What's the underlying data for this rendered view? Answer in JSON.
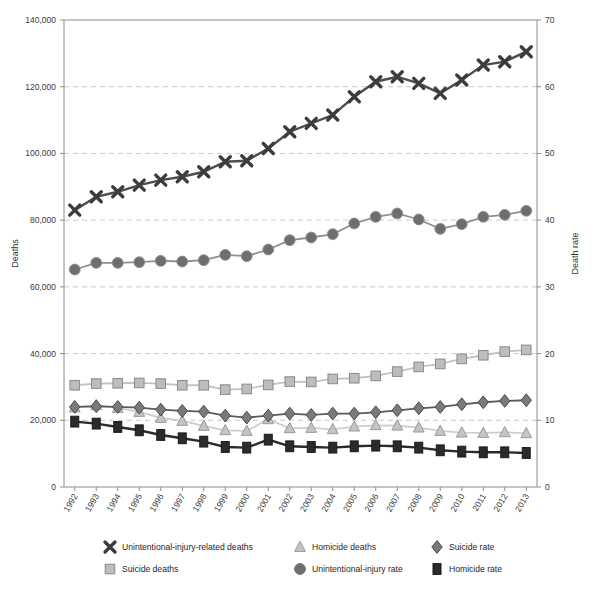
{
  "chart_data": {
    "type": "line",
    "title": "",
    "subtitle": "",
    "xlabel": "",
    "ylabel": "Deaths",
    "y2label": "Death rate",
    "grid": true,
    "legend_position": "bottom",
    "x": [
      "1992",
      "1993",
      "1994",
      "1995",
      "1996",
      "1997",
      "1998",
      "1999",
      "2000",
      "2001",
      "2002",
      "2003",
      "2004",
      "2005",
      "2006",
      "2007",
      "2008",
      "2009",
      "2010",
      "2011",
      "2012",
      "2013"
    ],
    "xtick_labels": [
      "1992",
      "1993",
      "1994",
      "1995",
      "1996",
      "1997",
      "1998",
      "1999",
      "2000",
      "2001",
      "2002",
      "2003",
      "2004",
      "2005",
      "2006",
      "2007",
      "2008",
      "2009",
      "2010",
      "2011",
      "2012",
      "2013"
    ],
    "ylim": [
      0,
      140000
    ],
    "ytick_labels": [
      "0",
      "20,000",
      "40,000",
      "60,000",
      "80,000",
      "100,000",
      "120,000",
      "140,000"
    ],
    "ytick_values": [
      0,
      20000,
      40000,
      60000,
      80000,
      100000,
      120000,
      140000
    ],
    "y2lim": [
      0,
      70
    ],
    "y2tick_labels": [
      "0",
      "10",
      "20",
      "30",
      "40",
      "50",
      "60",
      "70"
    ],
    "y2tick_values": [
      0,
      10,
      20,
      30,
      40,
      50,
      60,
      70
    ],
    "series": [
      {
        "name": "Unintentional-injury-related deaths",
        "marker": "x-cross",
        "axis": "left",
        "color": "#4d4d4d",
        "marker_fill": "#3c3c3c",
        "values": [
          83000,
          87000,
          88500,
          90500,
          92000,
          93000,
          94500,
          97500,
          97800,
          101500,
          106500,
          109000,
          111500,
          117000,
          121500,
          123000,
          121000,
          118000,
          122000,
          126500,
          127500,
          130500
        ]
      },
      {
        "name": "Suicide deaths",
        "marker": "square",
        "axis": "left",
        "color": "#c3c3c3",
        "marker_fill": "#bdbdbd",
        "values": [
          30500,
          31000,
          31100,
          31200,
          31000,
          30500,
          30500,
          29200,
          29400,
          30600,
          31600,
          31500,
          32400,
          32600,
          33300,
          34600,
          36000,
          36900,
          38400,
          39500,
          40600,
          41100
        ]
      },
      {
        "name": "Homicide deaths",
        "marker": "triangle",
        "axis": "left",
        "color": "#cdcdcd",
        "marker_fill": "#c4c4c4",
        "values": [
          23800,
          24500,
          23700,
          22500,
          20700,
          19800,
          18300,
          17000,
          16800,
          20300,
          17600,
          17700,
          17300,
          18100,
          18500,
          18400,
          17800,
          16800,
          16300,
          16200,
          16400,
          16100
        ]
      },
      {
        "name": "Unintentional-injury rate",
        "marker": "circle",
        "axis": "right",
        "color": "#8f8f8f",
        "marker_fill": "#6e6e6e",
        "values": [
          32.6,
          33.6,
          33.6,
          33.7,
          33.9,
          33.8,
          34.0,
          34.8,
          34.6,
          35.6,
          37.0,
          37.4,
          37.9,
          39.5,
          40.5,
          41.0,
          40.1,
          38.7,
          39.4,
          40.5,
          40.8,
          41.4
        ]
      },
      {
        "name": "Suicide rate",
        "marker": "diamond",
        "axis": "right",
        "color": "#5a5a5a",
        "marker_fill": "#7a7a7a",
        "values": [
          12.0,
          12.1,
          12.0,
          11.9,
          11.6,
          11.4,
          11.3,
          10.7,
          10.4,
          10.7,
          11.0,
          10.8,
          11.0,
          11.0,
          11.2,
          11.5,
          11.8,
          12.0,
          12.4,
          12.7,
          12.9,
          13.0
        ]
      },
      {
        "name": "Homicide rate",
        "marker": "rect-bar",
        "axis": "right",
        "color": "#2b2b2b",
        "marker_fill": "#2b2b2b",
        "values": [
          9.8,
          9.5,
          9.0,
          8.5,
          7.8,
          7.3,
          6.8,
          6.0,
          5.9,
          7.1,
          6.1,
          6.0,
          5.9,
          6.1,
          6.2,
          6.1,
          5.9,
          5.5,
          5.3,
          5.2,
          5.2,
          5.1
        ]
      }
    ],
    "legend": [
      {
        "label": "Unintentional-injury-related deaths",
        "marker": "x-cross",
        "color": "#3c3c3c"
      },
      {
        "label": "Homicide deaths",
        "marker": "triangle",
        "color": "#c4c4c4"
      },
      {
        "label": "Suicide rate",
        "marker": "diamond",
        "color": "#7a7a7a"
      },
      {
        "label": "Suicide deaths",
        "marker": "square",
        "color": "#bdbdbd"
      },
      {
        "label": "Unintentional-injury rate",
        "marker": "circle",
        "color": "#6e6e6e"
      },
      {
        "label": "Homicide rate",
        "marker": "rect-bar",
        "color": "#2b2b2b"
      }
    ]
  },
  "layout": {
    "plot_left": 64,
    "plot_right": 537,
    "plot_top": 20,
    "plot_bottom": 487
  }
}
